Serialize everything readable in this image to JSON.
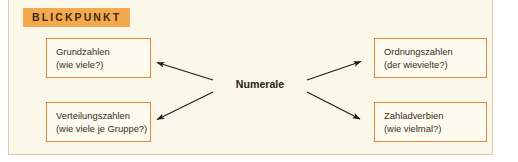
{
  "panel": {
    "background_color": "#FBF8E9",
    "border_color": "#D9CFAE"
  },
  "header": {
    "badge_label": "BLICKPUNKT",
    "badge_background_color": "#F5A94E",
    "badge_text_color": "#3B2A14"
  },
  "diagram": {
    "center": {
      "label": "Numerale"
    },
    "node_border_color": "#E3833C",
    "node_fill_color": "#FDFBF0",
    "arrow_color": "#1A1A1A",
    "nodes": [
      {
        "id": "grundzahlen",
        "title": "Grundzahlen",
        "question": "(wie viele?)",
        "position": "top-left"
      },
      {
        "id": "verteilungszahlen",
        "title": "Verteilungszahlen",
        "question": "(wie viele je Gruppe?)",
        "position": "bottom-left"
      },
      {
        "id": "ordnungszahlen",
        "title": "Ordnungszahlen",
        "question": "(der wievielte?)",
        "position": "top-right"
      },
      {
        "id": "zahladverbien",
        "title": "Zahladverbien",
        "question": "(wie vielmal?)",
        "position": "bottom-right"
      }
    ],
    "edges": [
      {
        "from": "Numerale",
        "to": "Grundzahlen",
        "direction": "up-left"
      },
      {
        "from": "Numerale",
        "to": "Verteilungszahlen",
        "direction": "down-left"
      },
      {
        "from": "Numerale",
        "to": "Ordnungszahlen",
        "direction": "up-right"
      },
      {
        "from": "Numerale",
        "to": "Zahladverbien",
        "direction": "down-right"
      }
    ]
  }
}
